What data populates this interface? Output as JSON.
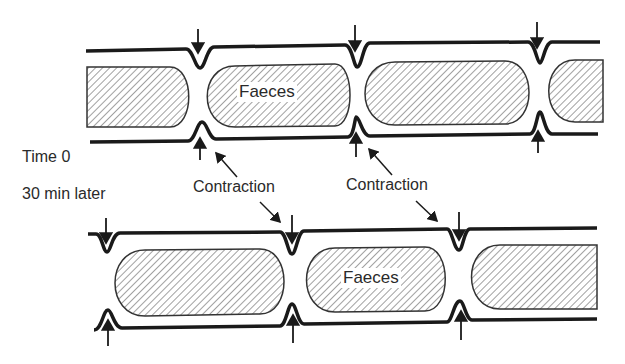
{
  "diagram": {
    "type": "segmentation-contractions-colon",
    "colors": {
      "stroke": "#1a1a1a",
      "text": "#2a2a2a",
      "background": "#ffffff"
    },
    "panels": [
      {
        "id": "time0",
        "label": "Time 0",
        "faeces_label": "Faeces"
      },
      {
        "id": "later",
        "label": "30 min later",
        "faeces_label": "Faeces"
      }
    ],
    "annotations": [
      {
        "text": "Contraction"
      },
      {
        "text": "Contraction"
      }
    ]
  }
}
